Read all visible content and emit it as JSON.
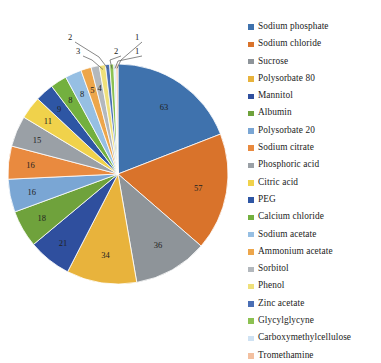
{
  "chart_data": {
    "type": "pie",
    "title": "",
    "subtitle": "",
    "xlabel": "",
    "ylabel": "",
    "legend_position": "right",
    "grid": false,
    "categories": [
      "Sodium phosphate",
      "Sodium chloride",
      "Sucrose",
      "Polysorbate 80",
      "Mannitol",
      "Albumin",
      "Polysorbate 20",
      "Sodium citrate",
      "Phosphoric acid",
      "Citric acid",
      "PEG",
      "Calcium chloride",
      "Sodium acetate",
      "Ammonium acetate",
      "Sorbitol",
      "Phenol",
      "Zinc acetate",
      "Glycylglycyne",
      "Carboxymethylcellulose",
      "Tromethamine"
    ],
    "values": [
      63,
      57,
      36,
      34,
      21,
      18,
      16,
      16,
      15,
      11,
      9,
      8,
      8,
      5,
      4,
      3,
      2,
      2,
      1,
      1
    ],
    "colors": [
      "#3f72ad",
      "#d9732b",
      "#8e9499",
      "#e8b33c",
      "#2f4f9e",
      "#6fa23c",
      "#7aa6d4",
      "#e98a3f",
      "#9aa0a6",
      "#f0d24b",
      "#2e56a4",
      "#73b03f",
      "#96bfe3",
      "#eda64b",
      "#b3b8bd",
      "#efe07a",
      "#4a6fb5",
      "#8cc152",
      "#cfe2f3",
      "#f3c0a0"
    ],
    "labeled_on_slice": [
      {
        "value": "63"
      },
      {
        "value": "57"
      },
      {
        "value": "36"
      },
      {
        "value": "34"
      },
      {
        "value": "21"
      },
      {
        "value": "18"
      },
      {
        "value": "16"
      },
      {
        "value": "16"
      },
      {
        "value": "15"
      },
      {
        "value": "11"
      },
      {
        "value": "9"
      },
      {
        "value": "8"
      },
      {
        "value": "8"
      },
      {
        "value": "5"
      },
      {
        "value": "4"
      }
    ],
    "callouts": [
      {
        "value": "3"
      },
      {
        "value": "2"
      },
      {
        "value": "2"
      },
      {
        "value": "1"
      },
      {
        "value": "1"
      }
    ]
  },
  "legend": {
    "items": [
      {
        "label": "Sodium phosphate",
        "color": "#3f72ad"
      },
      {
        "label": "Sodium chloride",
        "color": "#d9732b"
      },
      {
        "label": "Sucrose",
        "color": "#8e9499"
      },
      {
        "label": "Polysorbate 80",
        "color": "#e8b33c"
      },
      {
        "label": "Mannitol",
        "color": "#2f4f9e"
      },
      {
        "label": "Albumin",
        "color": "#6fa23c"
      },
      {
        "label": "Polysorbate 20",
        "color": "#7aa6d4"
      },
      {
        "label": "Sodium citrate",
        "color": "#e98a3f"
      },
      {
        "label": "Phosphoric acid",
        "color": "#9aa0a6"
      },
      {
        "label": "Citric acid",
        "color": "#f0d24b"
      },
      {
        "label": "PEG",
        "color": "#2e56a4"
      },
      {
        "label": "Calcium chloride",
        "color": "#73b03f"
      },
      {
        "label": "Sodium acetate",
        "color": "#96bfe3"
      },
      {
        "label": "Ammonium acetate",
        "color": "#eda64b"
      },
      {
        "label": "Sorbitol",
        "color": "#b3b8bd"
      },
      {
        "label": "Phenol",
        "color": "#efe07a"
      },
      {
        "label": "Zinc acetate",
        "color": "#4a6fb5"
      },
      {
        "label": "Glycylglycyne",
        "color": "#8cc152"
      },
      {
        "label": "Carboxymethylcellulose",
        "color": "#cfe2f3"
      },
      {
        "label": "Tromethamine",
        "color": "#f3c0a0"
      }
    ]
  },
  "pie_geometry": {
    "cx": 118,
    "cy": 174,
    "r": 110,
    "start_angle_deg": -90
  }
}
